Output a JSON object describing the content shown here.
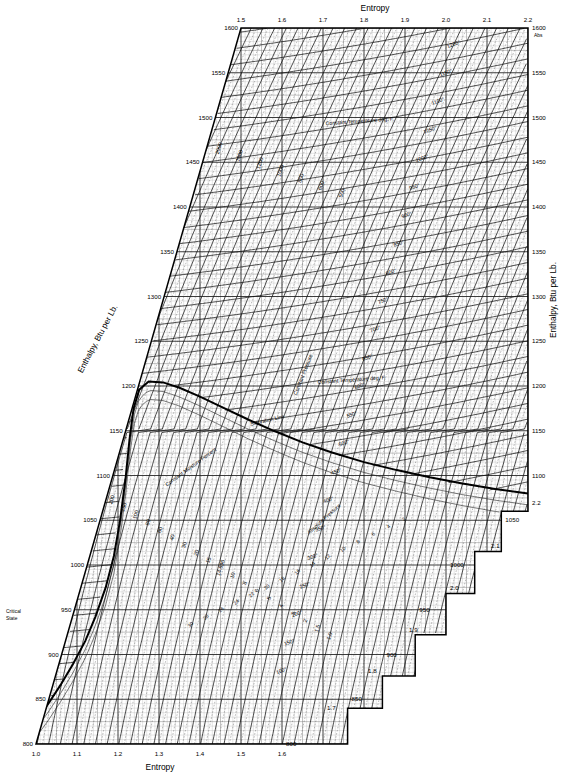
{
  "chart_data": {
    "type": "line",
    "xlabel": "Entropy",
    "ylabel": "Enthalpy, Btu per Lb.",
    "xlabel_bottom": "Entropy",
    "xlabel_top": "Entropy",
    "ylabel_left": "Enthalpy, Btu per Lb.",
    "ylabel_right": "Enthalpy, Btu per Lb.",
    "grid": true,
    "legend_position": "none",
    "xlim": [
      1.0,
      2.2
    ],
    "ylim": [
      800,
      1600
    ],
    "x_ticks_top": [
      "1.5",
      "1.6",
      "1.7",
      "1.8",
      "1.9",
      "2.0",
      "2.1",
      "2.2"
    ],
    "x_ticks_bottom": [
      "1.0",
      "1.1",
      "1.2",
      "1.3",
      "1.4",
      "1.5",
      "1.6"
    ],
    "y_ticks_left": [
      "1600",
      "1550",
      "1500",
      "1450",
      "1400",
      "1350",
      "1300",
      "1250",
      "1200",
      "1150",
      "1100",
      "1050",
      "1000",
      "950",
      "900",
      "850",
      "800"
    ],
    "y_ticks_right": [
      "1600",
      "1550",
      "1500",
      "1450",
      "1400",
      "1350",
      "1300",
      "1250",
      "1200",
      "1150",
      "1100"
    ],
    "y_ticks_step_right": [
      "1100",
      "1050",
      "1000",
      "950",
      "900",
      "850",
      "800"
    ],
    "x_ticks_step_right": [
      "2.2",
      "2.1",
      "2.0",
      "1.9",
      "1.8",
      "1.7"
    ],
    "annotations": [
      "Constant Temperature deg. F.",
      "Constant Temperature deg. F.",
      "Constant Pressure",
      "Constant Moisture Percent",
      "Saturation Line",
      "Absolute Pressure",
      "Critical State"
    ],
    "series": [
      {
        "name": "saturation-line",
        "note": "heavy curve, peak near s=1.23 h=1205"
      },
      {
        "name": "constant-pressure-lines",
        "note": "steep families labelled in psia"
      },
      {
        "name": "constant-temperature-lines",
        "note": "shallow families labelled in deg F"
      },
      {
        "name": "constant-moisture-lines",
        "note": "dashed family below saturation line"
      }
    ],
    "pressure_labels_upper": [
      "5500",
      "4000",
      "3000",
      "2000",
      "1600",
      "1200",
      "1000",
      "800",
      "600",
      "500"
    ],
    "pressure_labels_mid": [
      "400",
      "300",
      "250",
      "200",
      "150",
      "100",
      "80",
      "60",
      "40",
      "30",
      "20",
      "15",
      "14.696",
      "10",
      "8",
      "6",
      "5",
      "4",
      "3",
      "2",
      "1.5",
      "1.0"
    ],
    "temperature_labels": [
      "1200°",
      "1150°",
      "1100°",
      "1050°",
      "1000°",
      "950°",
      "900°",
      "850°",
      "800°",
      "750°",
      "700°",
      "650°",
      "600°",
      "550°",
      "500°",
      "450°",
      "400°",
      "350°",
      "300°",
      "250°",
      "200°",
      "150°",
      "100°"
    ],
    "moisture_labels": [
      "2",
      "4",
      "6",
      "8",
      "10",
      "12",
      "14",
      "16",
      "18",
      "20",
      "22",
      "24",
      "26",
      "28",
      "30"
    ]
  },
  "axes": {
    "top_title": "Entropy",
    "bottom_title": "Entropy",
    "left_title": "Enthalpy, Btu per Lb.",
    "right_title": "Enthalpy, Btu per Lb."
  },
  "labels": {
    "const_temp_upper": "Constant Temperature deg. F.",
    "const_temp_lower": "Constant Temperature deg. F.",
    "const_pressure": "Constant Pressure",
    "const_moisture": "Constant Moisture Percent",
    "saturation_line": "Saturation Line",
    "absolute_pressure": "Absolute Pressure",
    "critical_state_1": "Critical",
    "critical_state_2": "State",
    "abs_corner": "Abs"
  },
  "colors": {
    "ink": "#000000",
    "paper": "#ffffff",
    "grid": "#555555",
    "grid_light": "#999999"
  }
}
